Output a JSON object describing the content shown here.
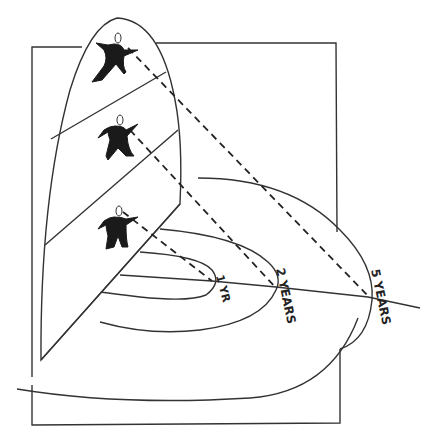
{
  "diagram": {
    "colors": {
      "ink": "#333333",
      "background": "#ffffff",
      "figure_fill": "#1a1a1a"
    },
    "labels": {
      "one_year": "1 YR",
      "two_years": "2 YEARS",
      "five_years": "5 YEARS"
    },
    "figures": [
      {
        "id": "top",
        "position": "upper panel section"
      },
      {
        "id": "middle",
        "position": "middle panel section"
      },
      {
        "id": "bottom",
        "position": "lower panel section"
      }
    ],
    "arcs": [
      "1 YR",
      "2 YEARS",
      "5 YEARS"
    ]
  }
}
